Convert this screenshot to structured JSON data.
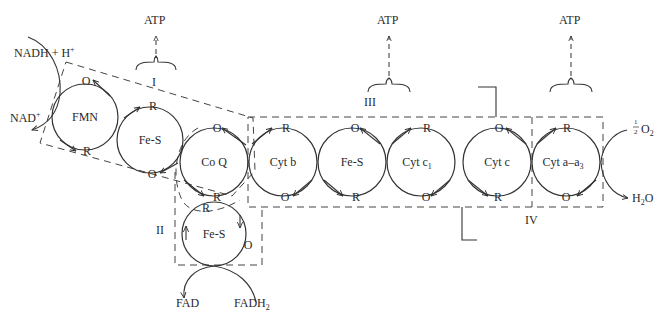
{
  "carriers": [
    {
      "id": "fmn",
      "label": "FMN",
      "top": "O",
      "bottom": "R"
    },
    {
      "id": "fes1",
      "label": "Fe-S",
      "top": "R",
      "bottom": "O"
    },
    {
      "id": "coq",
      "label": "Co Q",
      "top": "O",
      "bottom": "R"
    },
    {
      "id": "cytb",
      "label": "Cyt b",
      "top": "R",
      "bottom": "O"
    },
    {
      "id": "fes3",
      "label": "Fe-S",
      "top": "O",
      "bottom": "R"
    },
    {
      "id": "cytc1",
      "label": "Cyt c",
      "sub": "1",
      "top": "R",
      "bottom": "O"
    },
    {
      "id": "cytc",
      "label": "Cyt c",
      "top": "O",
      "bottom": "R"
    },
    {
      "id": "cytaa3",
      "label": "Cyt a–a",
      "sub": "3",
      "top": "R",
      "bottom": "O"
    },
    {
      "id": "fes2",
      "label": "Fe-S",
      "top": "R",
      "bottom": "O"
    }
  ],
  "complexes": {
    "I": "I",
    "II": "II",
    "III": "III",
    "IV": "IV"
  },
  "atp": {
    "label": "ATP",
    "sites": [
      "I",
      "III",
      "IV"
    ]
  },
  "substrates": {
    "nadh": "NADH + H",
    "nadh_sup": "+",
    "nad": "NAD",
    "nad_sup": "+",
    "fad": "FAD",
    "fadh2": "FADH",
    "fadh2_sub": "2",
    "o2_frac_num": "1",
    "o2_frac_den": "2",
    "o2": "O",
    "o2_sub": "2",
    "h2o_h": "H",
    "h2o_sub": "2",
    "h2o_o": "O"
  }
}
